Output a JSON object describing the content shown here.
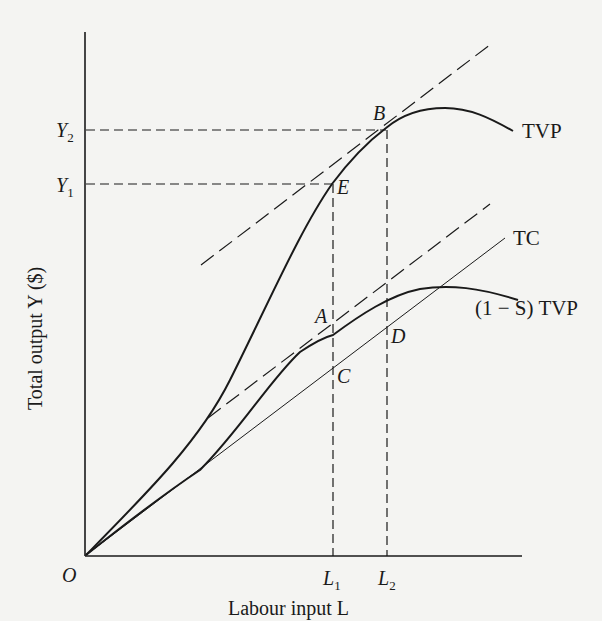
{
  "diagram": {
    "axes": {
      "y_label": "Total output Y ($)",
      "x_label": "Labour input L",
      "origin": "O"
    },
    "y_ticks": [
      {
        "main": "Y",
        "sub": "2"
      },
      {
        "main": "Y",
        "sub": "1"
      }
    ],
    "x_ticks": [
      {
        "main": "L",
        "sub": "1"
      },
      {
        "main": "L",
        "sub": "2"
      }
    ],
    "points": {
      "A": "A",
      "B": "B",
      "C": "C",
      "D": "D",
      "E": "E"
    },
    "curves": {
      "tvp": "TVP",
      "tc": "TC",
      "net_tvp": "(1 − S) TVP"
    },
    "colors": {
      "ink": "#1a1a1a",
      "paper": "#f4f4f2"
    }
  }
}
